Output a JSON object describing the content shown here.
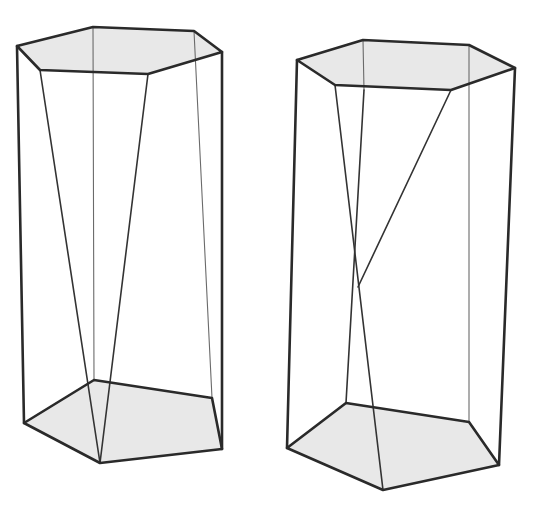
{
  "figures": [
    {
      "id": "left-prism",
      "description": "Hexagonal top face over pentagonal bottom face with two slanted edges converging to the front bottom vertex",
      "face_fill": "#e8e8e8",
      "edge_color": "#2a2a2a",
      "top_face": [
        [
          17,
          46
        ],
        [
          93,
          27
        ],
        [
          194,
          31
        ],
        [
          222,
          52
        ],
        [
          148,
          74
        ],
        [
          40,
          70
        ]
      ],
      "bottom_face": [
        [
          24,
          423
        ],
        [
          94,
          380
        ],
        [
          212,
          398
        ],
        [
          222,
          449
        ],
        [
          100,
          463
        ]
      ],
      "bold_edges": [
        [
          [
            17,
            46
          ],
          [
            24,
            423
          ]
        ],
        [
          [
            222,
            52
          ],
          [
            222,
            449
          ]
        ]
      ],
      "mid_edges": [
        [
          [
            40,
            70
          ],
          [
            100,
            463
          ]
        ],
        [
          [
            148,
            74
          ],
          [
            100,
            463
          ]
        ]
      ],
      "thin_edges": [
        [
          [
            93,
            27
          ],
          [
            94,
            380
          ]
        ],
        [
          [
            194,
            31
          ],
          [
            212,
            398
          ]
        ]
      ]
    },
    {
      "id": "right-prism",
      "description": "Hexagonal top face over pentagonal bottom face with crossing slanted edges",
      "face_fill": "#e8e8e8",
      "edge_color": "#2a2a2a",
      "top_face": [
        [
          297,
          60
        ],
        [
          363,
          40
        ],
        [
          469,
          45
        ],
        [
          515,
          68
        ],
        [
          451,
          90
        ],
        [
          335,
          85
        ]
      ],
      "bottom_face": [
        [
          287,
          448
        ],
        [
          346,
          403
        ],
        [
          469,
          422
        ],
        [
          499,
          465
        ],
        [
          383,
          490
        ]
      ],
      "bold_edges": [
        [
          [
            297,
            60
          ],
          [
            287,
            448
          ]
        ],
        [
          [
            515,
            68
          ],
          [
            499,
            465
          ]
        ]
      ],
      "mid_edges": [
        [
          [
            335,
            85
          ],
          [
            383,
            490
          ]
        ],
        [
          [
            364,
            90
          ],
          [
            346,
            403
          ]
        ],
        [
          [
            451,
            90
          ],
          [
            358,
            287
          ]
        ]
      ],
      "thin_edges": [
        [
          [
            363,
            40
          ],
          [
            364,
            90
          ]
        ],
        [
          [
            469,
            45
          ],
          [
            469,
            422
          ]
        ]
      ]
    }
  ]
}
